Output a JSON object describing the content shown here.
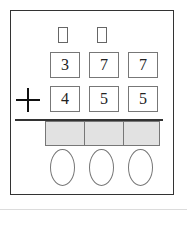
{
  "problem": {
    "operator": "+",
    "top_row": [
      "3",
      "7",
      "7"
    ],
    "bottom_row": [
      "4",
      "5",
      "5"
    ],
    "carry_boxes": 2,
    "answer_boxes": 3,
    "ovals": 3
  },
  "colors": {
    "answer_fill": "#e2e2e2",
    "border": "#777777"
  }
}
